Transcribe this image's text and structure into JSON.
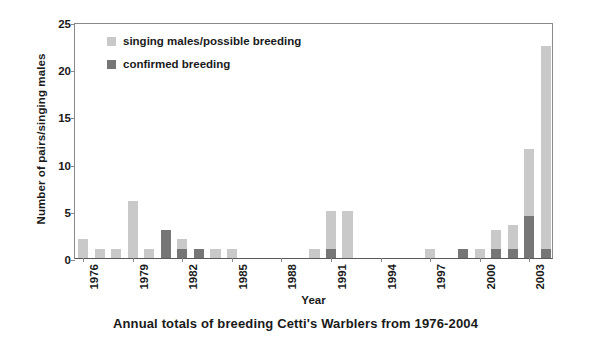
{
  "caption": "Annual totals of breeding Cetti's Warblers from 1976-2004",
  "legend": {
    "position": "top-left-inside",
    "items": [
      {
        "label": "singing males/possible breeding",
        "color": "#c9c9c9",
        "key": "singing"
      },
      {
        "label": "confirmed breeding",
        "color": "#767676",
        "key": "confirmed"
      }
    ]
  },
  "chart_data": {
    "type": "bar",
    "stacked": true,
    "title": "Annual totals of breeding Cetti's Warblers from 1976-2004",
    "xlabel": "Year",
    "ylabel": "Number of pairs/singing males",
    "ylim": [
      0,
      25
    ],
    "yticks": [
      0,
      5,
      10,
      15,
      20,
      25
    ],
    "grid": false,
    "xtick_labels": [
      "1976",
      "1979",
      "1982",
      "1985",
      "1988",
      "1991",
      "1994",
      "1997",
      "2000",
      "2003"
    ],
    "xtick_every": 3,
    "categories": [
      "1976",
      "1977",
      "1978",
      "1979",
      "1980",
      "1981",
      "1982",
      "1983",
      "1984",
      "1985",
      "1986",
      "1987",
      "1988",
      "1989",
      "1990",
      "1991",
      "1992",
      "1993",
      "1994",
      "1995",
      "1996",
      "1997",
      "1998",
      "1999",
      "2000",
      "2001",
      "2002",
      "2003",
      "2004"
    ],
    "series": [
      {
        "name": "confirmed breeding",
        "color": "#767676",
        "values": [
          0,
          0,
          0,
          0,
          0,
          3,
          1,
          1,
          0,
          0,
          0,
          0,
          0,
          0,
          0,
          1,
          0,
          0,
          0,
          0,
          0,
          0,
          0,
          1,
          0,
          1,
          1,
          4.5,
          1
        ]
      },
      {
        "name": "singing males/possible breeding",
        "color": "#c9c9c9",
        "values": [
          2,
          1,
          1,
          6,
          1,
          0,
          1,
          0,
          1,
          1,
          0,
          0,
          0,
          0,
          1,
          4,
          5,
          0,
          0,
          0,
          0,
          1,
          0,
          0,
          1,
          2,
          2.5,
          7,
          21.5
        ]
      }
    ],
    "totals": [
      2,
      1,
      1,
      6,
      1,
      3,
      2,
      1,
      1,
      1,
      0,
      0,
      0,
      0,
      1,
      5,
      5,
      0,
      0,
      0,
      0,
      1,
      0,
      1,
      1,
      3,
      3.5,
      11.5,
      22.5
    ]
  },
  "colors": {
    "singing": "#c9c9c9",
    "confirmed": "#767676",
    "axis": "#8a8a8a",
    "baseline": "#5a5a5a",
    "text": "#1a1a1a",
    "background": "#ffffff"
  }
}
